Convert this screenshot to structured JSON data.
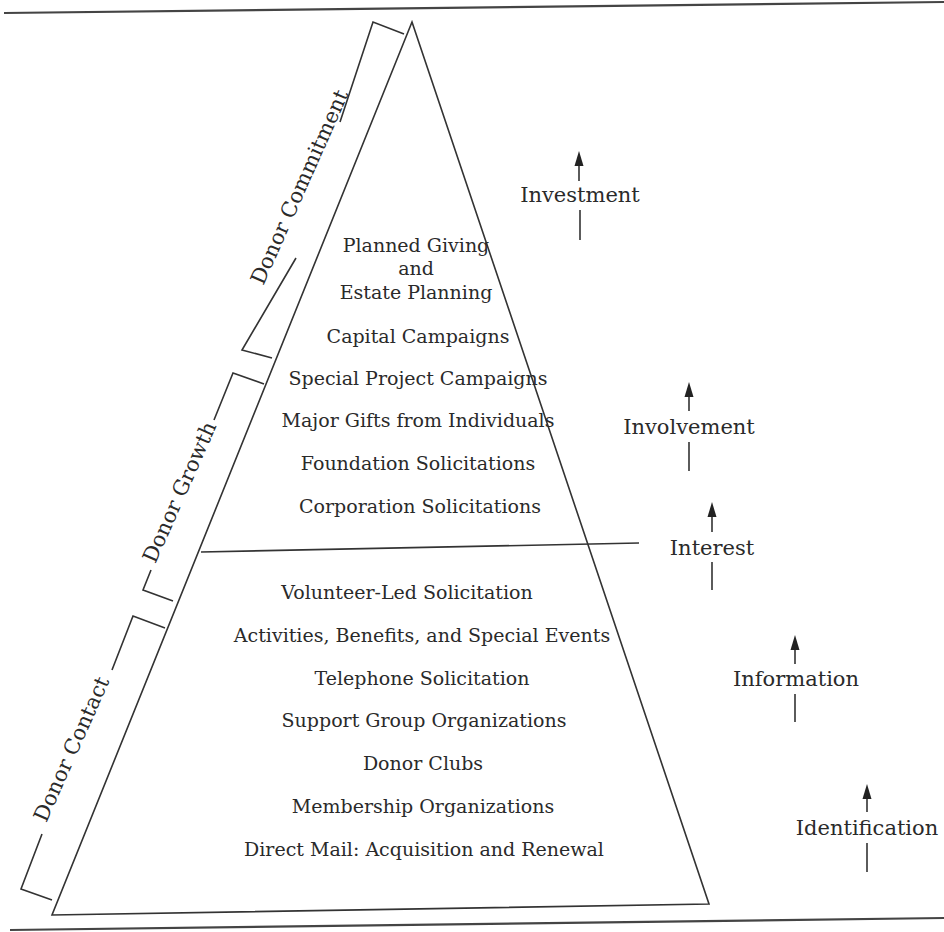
{
  "diagram": {
    "title": "",
    "type": "pyramid",
    "upper_section": {
      "items": [
        "Planned Giving",
        "and",
        "Estate Planning",
        "Capital Campaigns",
        "Special Project Campaigns",
        "Major Gifts from Individuals",
        "Foundation Solicitations",
        "Corporation Solicitations"
      ]
    },
    "lower_section": {
      "items": [
        "Volunteer-Led Solicitation",
        "Activities, Benefits, and Special Events",
        "Telephone Solicitation",
        "Support Group Organizations",
        "Donor Clubs",
        "Membership Organizations",
        "Direct Mail: Acquisition and Renewal"
      ]
    },
    "brackets": [
      {
        "label": "Donor Commitment"
      },
      {
        "label": "Donor Growth"
      },
      {
        "label": "Donor Contact"
      }
    ],
    "stages": [
      {
        "label": "Investment",
        "icon": "up-arrow-icon"
      },
      {
        "label": "Involvement",
        "icon": "up-arrow-icon"
      },
      {
        "label": "Interest",
        "icon": "up-arrow-icon"
      },
      {
        "label": "Information",
        "icon": "up-arrow-icon"
      },
      {
        "label": "Identification",
        "icon": "up-arrow-icon"
      }
    ]
  }
}
